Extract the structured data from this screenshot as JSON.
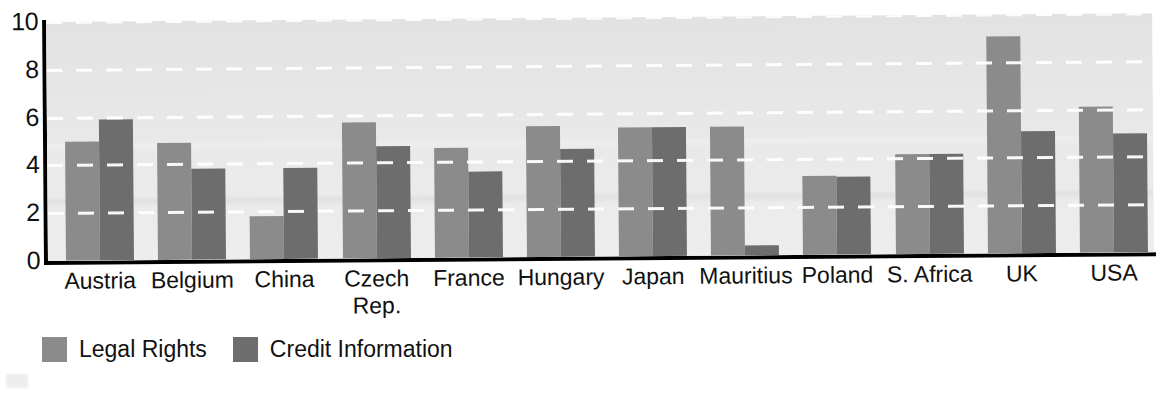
{
  "chart_data": {
    "type": "bar",
    "title": "",
    "subtitle": "",
    "xlabel": "",
    "ylabel": "",
    "ylim": [
      0,
      10
    ],
    "yticks": [
      0,
      2,
      4,
      6,
      8,
      10
    ],
    "ytick_labels": [
      "0",
      "2",
      "4",
      "6",
      "8",
      "10"
    ],
    "grid": true,
    "grid_style": "white dashed horizontal gridlines",
    "legend_position": "below-left",
    "categories": [
      "Austria",
      "Belgium",
      "China",
      "Czech\nRep.",
      "France",
      "Hungary",
      "Japan",
      "Mauritius",
      "Poland",
      "S. Africa",
      "UK",
      "USA"
    ],
    "series": [
      {
        "name": "Legal Rights",
        "color": "#8b8b8b",
        "values": [
          5.0,
          4.9,
          1.8,
          5.7,
          4.6,
          5.5,
          5.4,
          5.4,
          3.3,
          4.2,
          9.1,
          6.1
        ]
      },
      {
        "name": "Credit Information",
        "color": "#6d6d6d",
        "values": [
          5.9,
          3.8,
          3.8,
          4.7,
          3.6,
          4.5,
          5.4,
          0.4,
          3.25,
          4.2,
          5.1,
          5.0
        ]
      }
    ]
  },
  "legend": {
    "entries": [
      {
        "label": "Legal Rights",
        "swatch_name": "legend-swatch-legal-rights"
      },
      {
        "label": "Credit Information",
        "swatch_name": "legend-swatch-credit-information"
      }
    ]
  },
  "colors": {
    "series_legal_rights": "#8b8b8b",
    "series_credit_information": "#6d6d6d",
    "plot_background": "#e8e8e8",
    "axis": "#000000",
    "gridline": "#ffffff",
    "text": "#111111"
  }
}
